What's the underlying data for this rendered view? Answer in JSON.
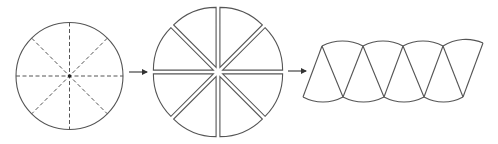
{
  "diagram": {
    "stroke_color": "#555555",
    "background": "#ffffff",
    "steps": [
      {
        "id": "circle",
        "label": "Circle divided into 8 sectors (dashed radii)",
        "center": [
          69.5,
          76
        ],
        "radius": 53.5,
        "sectors": 8,
        "radius_style": "dashed"
      },
      {
        "id": "sliced-circle",
        "label": "Sectors cut apart",
        "center": [
          218,
          72
        ],
        "radius": 60,
        "sectors": 8,
        "gap_offset": 5
      },
      {
        "id": "parallelogram",
        "label": "Sectors rearranged into parallelogram shape",
        "top_vertices_x": [
          322,
          363,
          403,
          443,
          483
        ],
        "top_y": 46,
        "bottom_vertices_x": [
          303,
          343,
          384,
          424,
          463
        ],
        "bottom_y": 97,
        "arc_sagitta": 5
      }
    ],
    "arrows": [
      {
        "id": "arrow-1",
        "from": [
          129,
          72
        ],
        "to": [
          148,
          72
        ]
      },
      {
        "id": "arrow-2",
        "from": [
          288,
          71
        ],
        "to": [
          307,
          71
        ]
      }
    ]
  }
}
